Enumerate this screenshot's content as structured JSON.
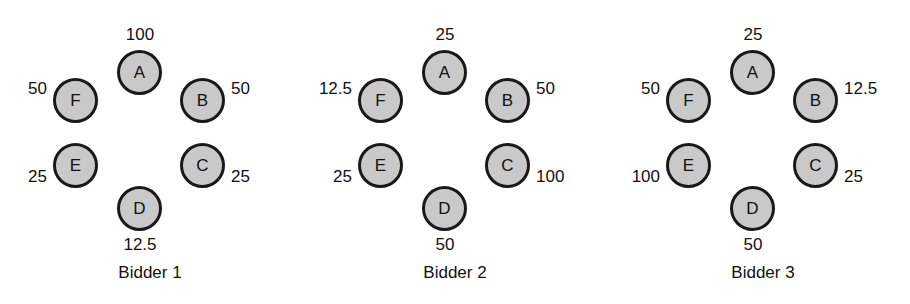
{
  "figure": {
    "node_fill_color": "#c9c9c9",
    "node_border_color": "#191919",
    "background_color": "#ffffff",
    "text_color": "#111111"
  },
  "groups": [
    {
      "caption": "Bidder 1",
      "nodes": [
        {
          "letter": "A",
          "value": "100"
        },
        {
          "letter": "B",
          "value": "50"
        },
        {
          "letter": "C",
          "value": "25"
        },
        {
          "letter": "D",
          "value": "12.5"
        },
        {
          "letter": "E",
          "value": "25"
        },
        {
          "letter": "F",
          "value": "50"
        }
      ]
    },
    {
      "caption": "Bidder 2",
      "nodes": [
        {
          "letter": "A",
          "value": "25"
        },
        {
          "letter": "B",
          "value": "50"
        },
        {
          "letter": "C",
          "value": "100"
        },
        {
          "letter": "D",
          "value": "50"
        },
        {
          "letter": "E",
          "value": "25"
        },
        {
          "letter": "F",
          "value": "12.5"
        }
      ]
    },
    {
      "caption": "Bidder 3",
      "nodes": [
        {
          "letter": "A",
          "value": "25"
        },
        {
          "letter": "B",
          "value": "12.5"
        },
        {
          "letter": "C",
          "value": "25"
        },
        {
          "letter": "D",
          "value": "50"
        },
        {
          "letter": "E",
          "value": "100"
        },
        {
          "letter": "F",
          "value": "50"
        }
      ]
    }
  ]
}
